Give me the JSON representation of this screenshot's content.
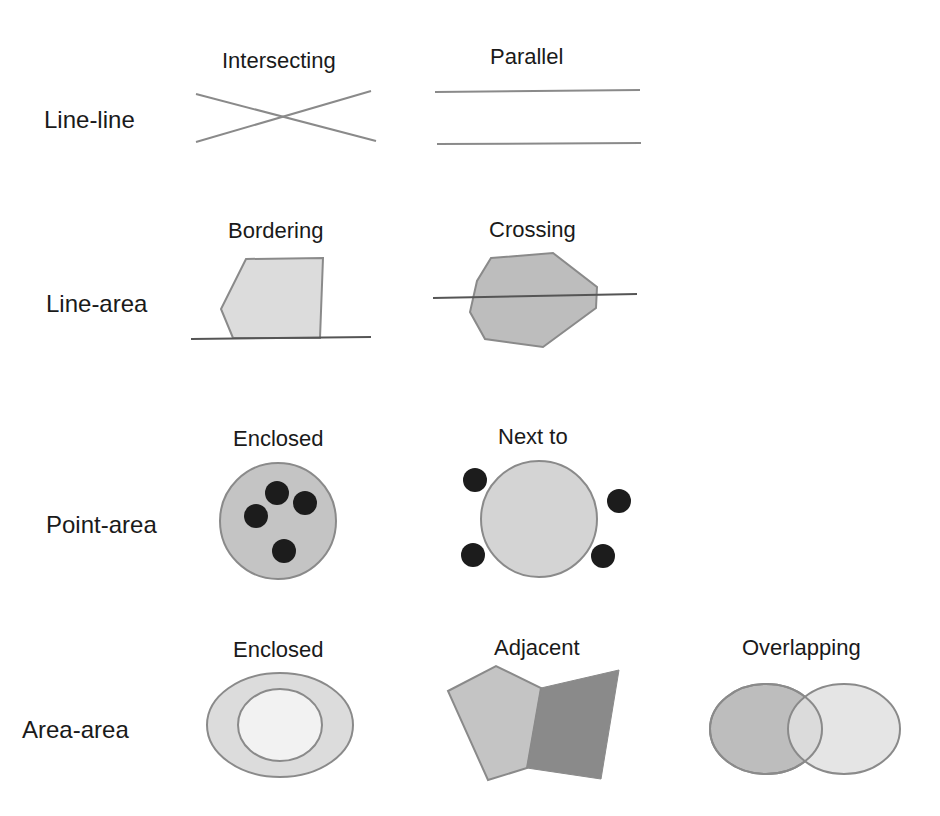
{
  "rows": [
    {
      "label": "Line-line",
      "items": [
        {
          "title": "Intersecting"
        },
        {
          "title": "Parallel"
        }
      ]
    },
    {
      "label": "Line-area",
      "items": [
        {
          "title": "Bordering"
        },
        {
          "title": "Crossing"
        }
      ]
    },
    {
      "label": "Point-area",
      "items": [
        {
          "title": "Enclosed"
        },
        {
          "title": "Next to"
        }
      ]
    },
    {
      "label": "Area-area",
      "items": [
        {
          "title": "Enclosed"
        },
        {
          "title": "Adjacent"
        },
        {
          "title": "Overlapping"
        }
      ]
    }
  ],
  "colors": {
    "stroke": "#888888",
    "line": "#555555",
    "fill_light": "#dcdcdc",
    "fill_mid": "#bdbdbd",
    "fill_dark": "#8a8a8a",
    "fill_lightest": "#f2f2f2",
    "point": "#1c1c1c"
  }
}
